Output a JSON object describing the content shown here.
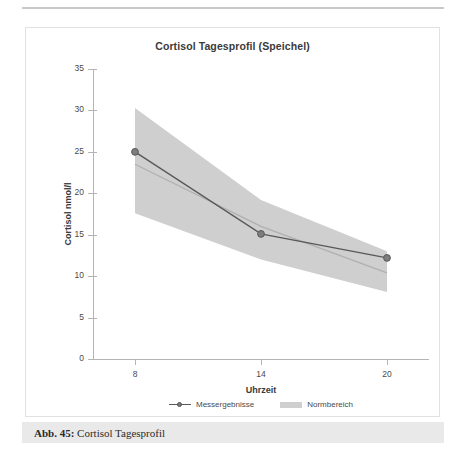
{
  "figure": {
    "caption_prefix": "Abb. 45:",
    "caption_text": "Cortisol Tagesprofil"
  },
  "chart_data": {
    "type": "line",
    "title": "Cortisol Tagesprofil (Speichel)",
    "xlabel": "Uhrzeit",
    "ylabel": "Cortisol nmol/l",
    "xlim": [
      6,
      22
    ],
    "ylim": [
      0,
      35
    ],
    "x_ticks": [
      8,
      14,
      20
    ],
    "x_tick_labels": [
      "8",
      "14",
      "20"
    ],
    "y_ticks": [
      0,
      5,
      10,
      15,
      20,
      25,
      30,
      35
    ],
    "y_tick_labels": [
      "0",
      "5",
      "10",
      "15",
      "20",
      "25",
      "30",
      "35"
    ],
    "grid": false,
    "legend_position": "bottom-center",
    "series": [
      {
        "name": "Messergebnisse",
        "type": "line-markers",
        "color": "#595959",
        "marker_color": "#7d7d7d",
        "x": [
          8,
          14,
          20
        ],
        "values": [
          25.0,
          15.1,
          12.2
        ]
      },
      {
        "name": "Normbereich",
        "type": "band",
        "color": "#cfcfcf",
        "x": [
          8,
          14,
          20
        ],
        "upper": [
          30.3,
          19.2,
          13.0
        ],
        "lower": [
          17.6,
          12.0,
          8.1
        ],
        "mid": [
          23.5,
          16.0,
          10.4
        ],
        "mid_color": "#b0b0b0"
      }
    ]
  },
  "legend": {
    "items": [
      {
        "label": "Messergebnisse",
        "marker": "line-marker-icon"
      },
      {
        "label": "Normbereich",
        "marker": "band-swatch-icon"
      }
    ]
  }
}
